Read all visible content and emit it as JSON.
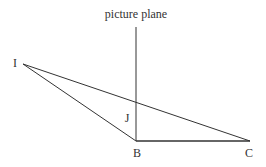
{
  "diagram": {
    "title_label": "picture plane",
    "points": {
      "I": {
        "label": "I",
        "x": 23,
        "y": 64
      },
      "B": {
        "label": "B",
        "x": 136,
        "y": 141
      },
      "C": {
        "label": "C",
        "x": 250,
        "y": 141
      },
      "J": {
        "label": "J",
        "x": 136,
        "y": 103
      }
    },
    "line_color": "#333333"
  }
}
